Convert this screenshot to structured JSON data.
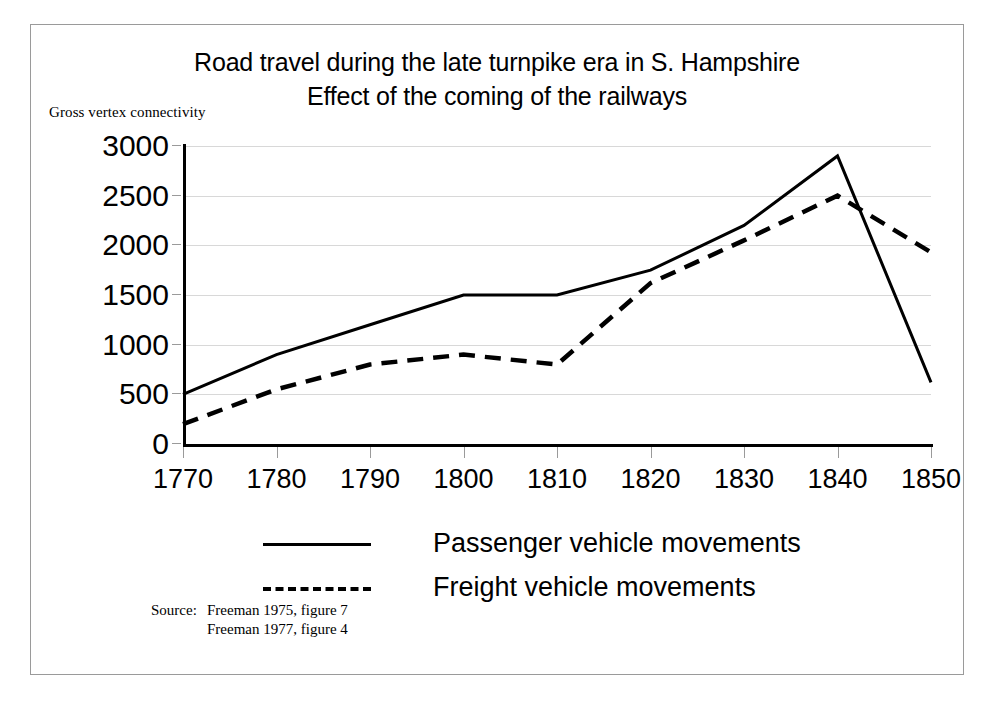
{
  "figure": {
    "title_line1": "Road travel during the  late turnpike era in S. Hampshire",
    "title_line2": "Effect of the coming of the railways",
    "axis_caption": "Gross vertex connectivity",
    "source_label": "Source:",
    "source_line1": "Freeman 1975, figure 7",
    "source_line2": "Freeman 1977, figure 4",
    "frame_color": "#9a9a9a",
    "gridline_color": "#d8d8d8",
    "line_color": "#000000"
  },
  "chart_data": {
    "type": "line",
    "xlabel": "",
    "ylabel": "Gross vertex connectivity",
    "x": [
      1770,
      1780,
      1790,
      1800,
      1810,
      1820,
      1830,
      1840,
      1850
    ],
    "xtick_labels": [
      "1770",
      "1780",
      "1790",
      "1800",
      "1810",
      "1820",
      "1830",
      "1840",
      "1850"
    ],
    "ytick_labels": [
      "0",
      "500",
      "1000",
      "1500",
      "2000",
      "2500",
      "3000"
    ],
    "yticks": [
      0,
      500,
      1000,
      1500,
      2000,
      2500,
      3000
    ],
    "ylim": [
      0,
      3000
    ],
    "xlim": [
      1770,
      1850
    ],
    "grid": true,
    "legend_position": "below-plot",
    "series": [
      {
        "name": "Passenger vehicle movements",
        "style": "solid",
        "values": [
          500,
          900,
          1200,
          1500,
          1500,
          1750,
          2200,
          2900,
          620
        ]
      },
      {
        "name": "Freight vehicle movements",
        "style": "dashed",
        "values": [
          200,
          550,
          800,
          900,
          800,
          1620,
          2050,
          2500,
          1930
        ]
      }
    ]
  }
}
